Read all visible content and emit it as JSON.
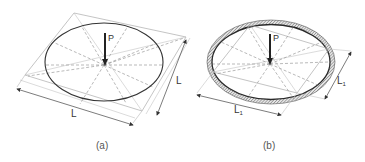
{
  "figure": {
    "panels": [
      {
        "id": "a",
        "caption": "(a)",
        "load_label": "P",
        "dimension_bottom_label": "L",
        "dimension_right_label": "L",
        "boundary": "simple ellipse outline"
      },
      {
        "id": "b",
        "caption": "(b)",
        "load_label": "P",
        "dimension_bottom_label": "L",
        "dimension_bottom_subscript": "1",
        "dimension_right_label": "L",
        "dimension_right_subscript": "1",
        "boundary": "ellipse with hatched ring (clamped edge)"
      }
    ],
    "colors": {
      "outline": "#333333",
      "construction_lines": "#b0b0b0",
      "dashed_lines": "#8a8a8a",
      "arrow": "#222222",
      "hatch": "#7a7a7a",
      "caption_text": "#555555"
    }
  }
}
